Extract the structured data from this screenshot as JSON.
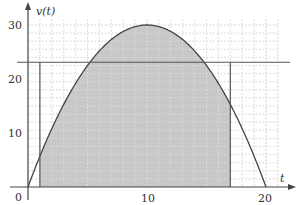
{
  "chart_data": {
    "type": "line",
    "title": "",
    "xlabel": "t",
    "ylabel": "v(t)",
    "xlim": [
      0,
      21
    ],
    "ylim": [
      0,
      31
    ],
    "x_ticks": [
      0,
      10,
      20
    ],
    "y_ticks": [
      10,
      20,
      30
    ],
    "x_tick_labels": [
      "0",
      "10",
      "20"
    ],
    "y_tick_labels": [
      "10",
      "20",
      "30"
    ],
    "grid": true,
    "series": [
      {
        "name": "v(t)",
        "formula": "30 - 0.3*(t-10)^2",
        "x": [
          0,
          2,
          4,
          6,
          8,
          10,
          12,
          14,
          16,
          18,
          20
        ],
        "values": [
          0,
          10.8,
          19.2,
          25.2,
          28.8,
          30,
          28.8,
          25.2,
          19.2,
          10.8,
          0
        ]
      }
    ],
    "shaded_region": {
      "from_t": 1,
      "to_t": 17,
      "under": "v(t)",
      "color": "#c8c8c8"
    },
    "horizontal_line": {
      "v": 23.1
    },
    "vertical_lines": [
      {
        "t": 1
      },
      {
        "t": 17
      }
    ],
    "colors": {
      "curve": "#444444",
      "fill": "#c8c8c8",
      "grid": "#b0b0b0",
      "axis": "#444444"
    }
  },
  "labels": {
    "y_axis": "v(t)",
    "x_axis": "t",
    "origin": "0",
    "x10": "10",
    "x20": "20",
    "y10": "10",
    "y20": "20",
    "y30": "30"
  }
}
